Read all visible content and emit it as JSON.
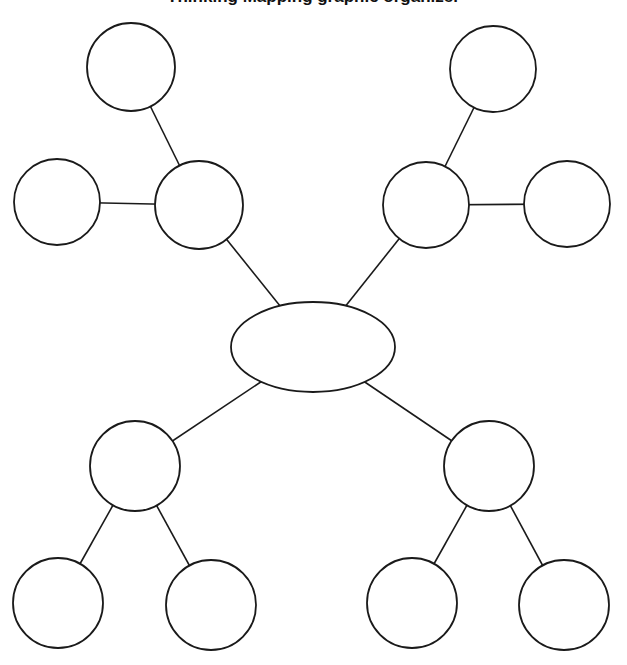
{
  "title": "Thinking Mapping graphic organizer",
  "stroke_color": "#1a1a1a",
  "fill_color": "#ffffff",
  "center": {
    "cx": 313,
    "cy": 347,
    "rx": 82,
    "ry": 45,
    "label": ""
  },
  "nodes": [
    {
      "id": "upper-left-hub",
      "cx": 199,
      "cy": 205,
      "r": 44,
      "label": ""
    },
    {
      "id": "upper-left-top",
      "cx": 131,
      "cy": 67,
      "r": 44,
      "label": ""
    },
    {
      "id": "upper-left-side",
      "cx": 57,
      "cy": 202,
      "r": 43,
      "label": ""
    },
    {
      "id": "upper-right-hub",
      "cx": 426,
      "cy": 205,
      "r": 43,
      "label": ""
    },
    {
      "id": "upper-right-top",
      "cx": 493,
      "cy": 69,
      "r": 43,
      "label": ""
    },
    {
      "id": "upper-right-side",
      "cx": 567,
      "cy": 204,
      "r": 43,
      "label": ""
    },
    {
      "id": "lower-left-hub",
      "cx": 135,
      "cy": 466,
      "r": 45,
      "label": ""
    },
    {
      "id": "lower-left-a",
      "cx": 58,
      "cy": 603,
      "r": 45,
      "label": ""
    },
    {
      "id": "lower-left-b",
      "cx": 211,
      "cy": 605,
      "r": 45,
      "label": ""
    },
    {
      "id": "lower-right-hub",
      "cx": 489,
      "cy": 466,
      "r": 45,
      "label": ""
    },
    {
      "id": "lower-right-a",
      "cx": 412,
      "cy": 603,
      "r": 45,
      "label": ""
    },
    {
      "id": "lower-right-b",
      "cx": 564,
      "cy": 605,
      "r": 45,
      "label": ""
    }
  ],
  "edges": [
    [
      "center",
      "upper-left-hub"
    ],
    [
      "center",
      "upper-right-hub"
    ],
    [
      "center",
      "lower-left-hub"
    ],
    [
      "center",
      "lower-right-hub"
    ],
    [
      "upper-left-hub",
      "upper-left-top"
    ],
    [
      "upper-left-hub",
      "upper-left-side"
    ],
    [
      "upper-right-hub",
      "upper-right-top"
    ],
    [
      "upper-right-hub",
      "upper-right-side"
    ],
    [
      "lower-left-hub",
      "lower-left-a"
    ],
    [
      "lower-left-hub",
      "lower-left-b"
    ],
    [
      "lower-right-hub",
      "lower-right-a"
    ],
    [
      "lower-right-hub",
      "lower-right-b"
    ]
  ]
}
